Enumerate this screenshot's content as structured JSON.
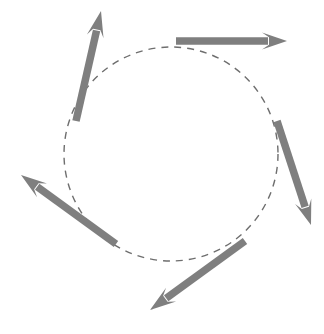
{
  "figure": {
    "title": "",
    "kind": "vector-field-diagram",
    "width": 324,
    "height": 334,
    "background_color": "#ffffff"
  },
  "chart_data": {
    "type": "scatter",
    "title": "",
    "subtitle": "",
    "xlabel": "",
    "ylabel": "",
    "xlim": [
      0,
      324
    ],
    "ylim": [
      0,
      334
    ],
    "grid": false,
    "legend": "none",
    "annotations": [],
    "tick_labels": {
      "x": [],
      "y": []
    },
    "guide_circle": {
      "name": "dashed-reference-circle",
      "center_x": 171,
      "center_y": 154,
      "radius": 107,
      "stroke_color": "#6e6e6e",
      "stroke_width": 1.4,
      "dash_pattern": "7 6",
      "style": "dashed"
    },
    "series": [
      {
        "name": "tangential-vectors",
        "marker": "arrow",
        "color": "#7f7f7f",
        "values": [
          {
            "id": "arrow-upper-left",
            "label": "upper-left",
            "tail_x": 76,
            "tail_y": 121,
            "tip_x": 101,
            "tip_y": 11,
            "angle_deg": 77,
            "length": 113,
            "shaft_width": 7.5,
            "head_length": 26,
            "head_width": 17
          },
          {
            "id": "arrow-top-right",
            "label": "top-right",
            "tail_x": 176,
            "tail_y": 41,
            "tip_x": 287,
            "tip_y": 41,
            "angle_deg": 0,
            "length": 111,
            "shaft_width": 7.5,
            "head_length": 25,
            "head_width": 17
          },
          {
            "id": "arrow-right",
            "label": "right",
            "tail_x": 277,
            "tail_y": 121,
            "tip_x": 311,
            "tip_y": 225,
            "angle_deg": -72,
            "length": 109,
            "shaft_width": 7.5,
            "head_length": 25,
            "head_width": 17
          },
          {
            "id": "arrow-bottom",
            "label": "bottom",
            "tail_x": 245,
            "tail_y": 241,
            "tip_x": 150,
            "tip_y": 310,
            "angle_deg": 216,
            "length": 117,
            "shaft_width": 7.5,
            "head_length": 26,
            "head_width": 17
          },
          {
            "id": "arrow-left",
            "label": "left",
            "tail_x": 116,
            "tail_y": 244,
            "tip_x": 21,
            "tip_y": 175,
            "angle_deg": 144,
            "length": 117,
            "shaft_width": 7.5,
            "head_length": 26,
            "head_width": 17
          }
        ]
      }
    ]
  }
}
